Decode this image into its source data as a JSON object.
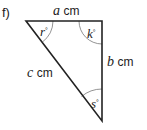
{
  "figure": {
    "part_label": "f)",
    "shape": "right triangle",
    "stroke_color": "#222222",
    "arc_color": "#666666",
    "sides": {
      "top": {
        "variable": "a",
        "unit": "cm"
      },
      "right": {
        "variable": "b",
        "unit": "cm"
      },
      "hypotenuse": {
        "variable": "c",
        "unit": "cm"
      }
    },
    "angles": {
      "top_left": {
        "variable": "r",
        "symbol": "°"
      },
      "top_right": {
        "variable": "k",
        "symbol": "°"
      },
      "bottom": {
        "variable": "s",
        "symbol": "°"
      }
    }
  }
}
